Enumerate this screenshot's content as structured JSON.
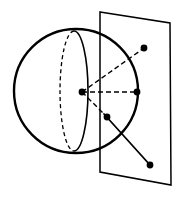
{
  "figure": {
    "background_color": "#ffffff",
    "ink_color": "#000000",
    "canvas": {
      "width": 180,
      "height": 204
    },
    "sphere": {
      "label": "sphere-outline",
      "center_x": 76,
      "center_y": 91,
      "radius": 62,
      "stroke_color": "#000000",
      "stroke_width": 2.4,
      "fill": "none"
    },
    "great_circle": {
      "label": "great-circle-ellipse",
      "center_x": 74,
      "center_y": 91,
      "radius_x": 14,
      "radius_y": 60,
      "front_half": {
        "style": "solid",
        "stroke_width": 1.6,
        "path": "M 74 31 A 14 60 0 0 1 74 151"
      },
      "back_half": {
        "style": "dashed",
        "stroke_width": 1.3,
        "dash_pattern": "4 3",
        "path": "M 74 31 A 14 60 0 0 0 74 151"
      }
    },
    "plane": {
      "label": "intersecting-plane",
      "style": "solid",
      "stroke_width": 1.5,
      "fill": "none",
      "corners": [
        {
          "name": "top-left",
          "x": 100,
          "y": 12
        },
        {
          "name": "top-right",
          "x": 170,
          "y": 23
        },
        {
          "name": "bottom-right",
          "x": 171,
          "y": 185
        },
        {
          "name": "bottom-left",
          "x": 100,
          "y": 172
        }
      ],
      "points_path": "100,12 170,23 171,185 100,172"
    },
    "points": [
      {
        "name": "center-point",
        "x": 82,
        "y": 92,
        "radius": 3.4
      },
      {
        "name": "upper-right-point",
        "x": 144,
        "y": 48,
        "radius": 3.4
      },
      {
        "name": "sphere-right-point",
        "x": 137,
        "y": 92,
        "radius": 3.4
      },
      {
        "name": "mid-point",
        "x": 107,
        "y": 117,
        "radius": 3.4
      },
      {
        "name": "lower-right-point",
        "x": 150,
        "y": 165,
        "radius": 3.4
      }
    ],
    "dashed_rays": [
      {
        "name": "ray-center-to-upper-right",
        "x1": 82,
        "y1": 92,
        "x2": 144,
        "y2": 48,
        "style": "dashed",
        "dash_pattern": "5 3",
        "stroke_width": 1.4
      },
      {
        "name": "ray-center-to-sphere-right",
        "x1": 82,
        "y1": 92,
        "x2": 137,
        "y2": 92,
        "style": "dashed",
        "dash_pattern": "5 3",
        "stroke_width": 1.4
      },
      {
        "name": "ray-center-to-mid-point",
        "x1": 82,
        "y1": 92,
        "x2": 107,
        "y2": 117,
        "style": "dashed",
        "dash_pattern": "5 3",
        "stroke_width": 1.4
      }
    ],
    "solid_secant_line": {
      "name": "secant-line-mid-to-lower-right",
      "x1": 104,
      "y1": 114,
      "x2": 150,
      "y2": 165,
      "style": "solid",
      "stroke_width": 1.8
    }
  }
}
